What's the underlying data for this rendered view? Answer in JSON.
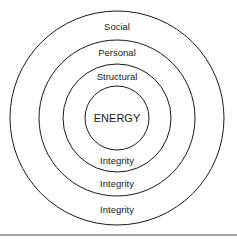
{
  "diagram": {
    "type": "concentric-circles",
    "rings": [
      {
        "id": "social",
        "top_label": "Social",
        "bottom_label": "Integrity"
      },
      {
        "id": "personal",
        "top_label": "Personal",
        "bottom_label": "Integrity"
      },
      {
        "id": "structural",
        "top_label": "Structural",
        "bottom_label": "Integrity"
      }
    ],
    "center_label": "ENERGY",
    "colors": {
      "stroke": "#1a1a1a",
      "rule": "#8a8a8a",
      "background": "#ffffff"
    }
  }
}
